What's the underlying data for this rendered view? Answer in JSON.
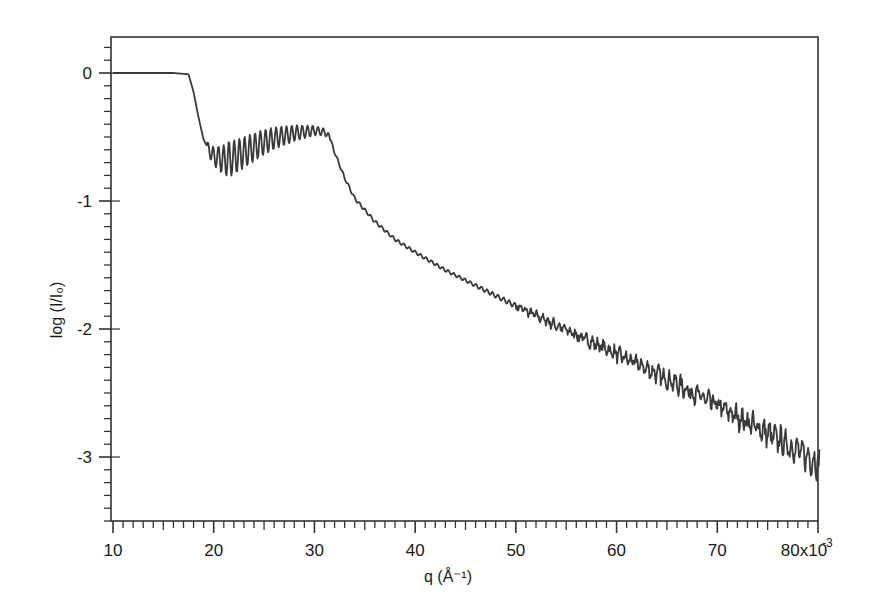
{
  "chart_data": {
    "type": "line",
    "title": "",
    "xlabel": "q (Å⁻¹)",
    "ylabel": "log (I/I₀)",
    "x_multiplier_label": "x10⁻³",
    "xlim": [
      10,
      80.2
    ],
    "ylim": [
      -3.5,
      0.28
    ],
    "grid": false,
    "legend": null,
    "x_ticks": [
      10,
      20,
      30,
      40,
      50,
      60,
      70,
      80
    ],
    "x_tick_labels": [
      "10",
      "20",
      "30",
      "40",
      "50",
      "60",
      "70",
      "80x10"
    ],
    "x_tick_exponent": "-3",
    "y_ticks": [
      0,
      -1,
      -2,
      -3
    ],
    "y_tick_labels": [
      "0",
      "-1",
      "-2",
      "-3"
    ],
    "series": [
      {
        "name": "reflectivity",
        "color": "#3a3a3a",
        "x": [
          10,
          12,
          14,
          16,
          17.5,
          18,
          18.5,
          19,
          19.5,
          20,
          21,
          22,
          23,
          24,
          25,
          26,
          27,
          28,
          29,
          30,
          31,
          31.5,
          32,
          33,
          34,
          36,
          38,
          40,
          43,
          46,
          50,
          54,
          58,
          62,
          66,
          70,
          74,
          78,
          80
        ],
        "values": [
          0.0,
          0.0,
          0.0,
          0.0,
          -0.01,
          -0.15,
          -0.35,
          -0.52,
          -0.6,
          -0.65,
          -0.68,
          -0.66,
          -0.62,
          -0.58,
          -0.54,
          -0.51,
          -0.49,
          -0.47,
          -0.46,
          -0.45,
          -0.46,
          -0.5,
          -0.62,
          -0.82,
          -0.98,
          -1.16,
          -1.3,
          -1.4,
          -1.54,
          -1.66,
          -1.82,
          -1.97,
          -2.12,
          -2.27,
          -2.43,
          -2.6,
          -2.77,
          -2.95,
          -3.05
        ]
      }
    ],
    "annotations": {
      "oscillation_region_q": [
        19.5,
        31.5
      ],
      "oscillation_amplitude_min_region": 0.15,
      "noise_region_q": [
        55,
        80
      ]
    }
  }
}
